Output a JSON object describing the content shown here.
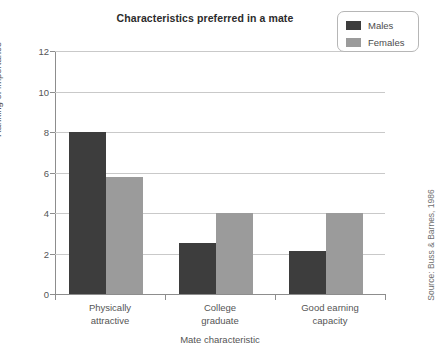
{
  "chart_data": {
    "type": "bar",
    "title": "Characteristics preferred in a mate",
    "xlabel": "Mate characteristic",
    "ylabel": "Ranking of importance",
    "categories": [
      "Physically attractive",
      "College graduate",
      "Good earning capacity"
    ],
    "category_lines": [
      [
        "Physically",
        "attractive"
      ],
      [
        "College",
        "graduate"
      ],
      [
        "Good earning",
        "capacity"
      ]
    ],
    "series": [
      {
        "name": "Males",
        "color": "#3d3d3d",
        "values": [
          8.0,
          2.5,
          2.1
        ]
      },
      {
        "name": "Females",
        "color": "#9b9b9b",
        "values": [
          5.8,
          4.0,
          4.0
        ]
      }
    ],
    "ylim": [
      0,
      12
    ],
    "yticks": [
      0,
      2,
      4,
      6,
      8,
      10,
      12
    ],
    "ytick_labels": [
      "0",
      "2",
      "4",
      "6",
      "8",
      "10",
      "12"
    ],
    "grid": true,
    "legend_position": "top-right",
    "source_note": "Source: Buss & Barnes, 1986"
  },
  "legend": {
    "items": [
      {
        "label": "Males",
        "color": "#3d3d3d"
      },
      {
        "label": "Females",
        "color": "#9b9b9b"
      }
    ]
  },
  "colors": {
    "males": "#3d3d3d",
    "females": "#9b9b9b",
    "axis": "#8d8d8d",
    "grid": "#c9c9c9",
    "text": "#555555",
    "title": "#2b2b2b"
  }
}
